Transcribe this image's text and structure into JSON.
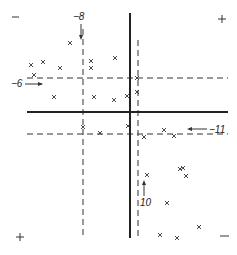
{
  "figure": {
    "quadrant_signs": {
      "top_left": "−",
      "top_right": "+",
      "bottom_left": "+",
      "bottom_right": "−"
    },
    "axes": {
      "horizontal_y": 112,
      "vertical_x": 130,
      "x_range": [
        27,
        228
      ],
      "y_range": [
        13,
        238
      ]
    },
    "threshold_lines": [
      {
        "id": "h-6",
        "orientation": "horizontal",
        "position": 78,
        "label": "−6",
        "label_side": "left",
        "arrow": "right"
      },
      {
        "id": "h-11",
        "orientation": "horizontal",
        "position": 134,
        "label": "−11",
        "label_side": "right",
        "arrow": "left"
      },
      {
        "id": "v-8",
        "orientation": "vertical",
        "position": 83,
        "label": "−8",
        "label_side": "top",
        "arrow": "down"
      },
      {
        "id": "v-10",
        "orientation": "vertical",
        "position": 138,
        "label": "−10",
        "label_side": "bottom",
        "arrow": "up"
      }
    ],
    "labels": {
      "h6": "−6",
      "h11": "−11",
      "v8": "−8",
      "v10": "10"
    },
    "points": [
      [
        70,
        43
      ],
      [
        31,
        65
      ],
      [
        43,
        62
      ],
      [
        60,
        68
      ],
      [
        91,
        61
      ],
      [
        91,
        68
      ],
      [
        34,
        75
      ],
      [
        115,
        58
      ],
      [
        137,
        78
      ],
      [
        137,
        92
      ],
      [
        54,
        97
      ],
      [
        94,
        97
      ],
      [
        114,
        100
      ],
      [
        127,
        96
      ],
      [
        83,
        127
      ],
      [
        100,
        133
      ],
      [
        128,
        126
      ],
      [
        144,
        137
      ],
      [
        164,
        130
      ],
      [
        174,
        136
      ],
      [
        147,
        175
      ],
      [
        183,
        168
      ],
      [
        180,
        169
      ],
      [
        186,
        176
      ],
      [
        167,
        203
      ],
      [
        199,
        227
      ],
      [
        160,
        235
      ],
      [
        177,
        238
      ]
    ],
    "marker_symbol": "×"
  }
}
